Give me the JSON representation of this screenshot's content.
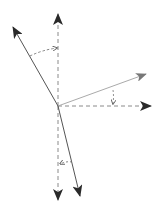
{
  "diagram": {
    "title": "",
    "colors": {
      "solid": "#444444",
      "light": "#9a9a9a",
      "dashed": "#8a8a8a",
      "arrowhead": "#2a2a2a",
      "background": "#ffffff"
    },
    "origin": [
      58,
      106
    ],
    "vectors": [
      {
        "id": "axis-up",
        "style": "dashed",
        "from": [
          58,
          106
        ],
        "to": [
          58,
          14
        ]
      },
      {
        "id": "vector-up-left",
        "style": "solid",
        "from": [
          58,
          106
        ],
        "to": [
          13,
          27
        ]
      },
      {
        "id": "vector-right-up",
        "style": "light",
        "from": [
          58,
          106
        ],
        "to": [
          146,
          74
        ]
      },
      {
        "id": "axis-right",
        "style": "dashed",
        "from": [
          58,
          106
        ],
        "to": [
          151,
          106
        ]
      },
      {
        "id": "axis-down",
        "style": "dashed",
        "from": [
          58,
          106
        ],
        "to": [
          58,
          200
        ]
      },
      {
        "id": "vector-down",
        "style": "solid",
        "from": [
          58,
          106
        ],
        "to": [
          80,
          196
        ]
      }
    ],
    "angle_markers": [
      {
        "id": "angle-upper",
        "from": [
          30,
          56
        ],
        "to": [
          57,
          48
        ]
      },
      {
        "id": "angle-right",
        "from": [
          113,
          91
        ],
        "to": [
          113,
          104
        ]
      },
      {
        "id": "angle-lower",
        "from": [
          73,
          162
        ],
        "to": [
          60,
          164
        ]
      }
    ],
    "labels": []
  }
}
